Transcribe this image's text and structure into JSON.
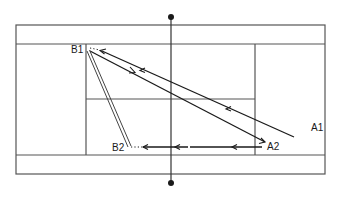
{
  "diagram": {
    "type": "tennis-court-shot-diagram",
    "colors": {
      "court_lines": "#555555",
      "shot_lines": "#1a1a1a",
      "background": "#ffffff"
    },
    "players": [
      {
        "id": "B1",
        "label": "B1"
      },
      {
        "id": "B2",
        "label": "B2"
      },
      {
        "id": "A1",
        "label": "A1"
      },
      {
        "id": "A2",
        "label": "A2"
      }
    ],
    "shots": [
      {
        "from": "A1",
        "to": "B1",
        "style": "single-arrow"
      },
      {
        "from": "B1",
        "to": "A2",
        "style": "single-arrow"
      },
      {
        "from": "A2",
        "to": "B2",
        "style": "single-arrow"
      },
      {
        "from": "B1",
        "to": "B2",
        "style": "double-line"
      }
    ]
  }
}
